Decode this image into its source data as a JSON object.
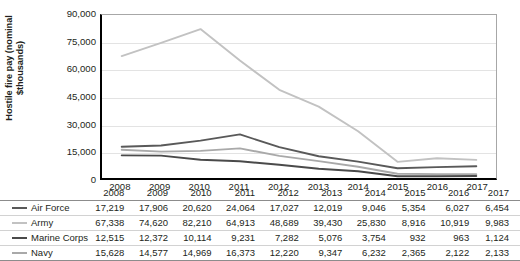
{
  "chart_data": {
    "type": "line",
    "title": "",
    "xlabel": "",
    "ylabel": "Hostile fire pay (nominal $thousands)",
    "categories": [
      "2008",
      "2009",
      "2010",
      "2011",
      "2012",
      "2013",
      "2014",
      "2015",
      "2016",
      "2017"
    ],
    "ylim": [
      0,
      90000
    ],
    "yticks": [
      "0",
      "15,000",
      "30,000",
      "45,000",
      "60,000",
      "75,000",
      "90,000"
    ],
    "ytick_values": [
      0,
      15000,
      30000,
      45000,
      60000,
      75000,
      90000
    ],
    "grid": true,
    "legend_position": "table-left",
    "series": [
      {
        "name": "Air Force",
        "color": "#595959",
        "values": [
          17219,
          17906,
          20620,
          24064,
          17027,
          12019,
          9046,
          5354,
          6027,
          6454
        ],
        "labels": [
          "17,219",
          "17,906",
          "20,620",
          "24,064",
          "17,027",
          "12,019",
          "9,046",
          "5,354",
          "6,027",
          "6,454"
        ]
      },
      {
        "name": "Army",
        "color": "#c2c2c2",
        "values": [
          67338,
          74620,
          82210,
          64913,
          48689,
          39430,
          25830,
          8916,
          10919,
          9983
        ],
        "labels": [
          "67,338",
          "74,620",
          "82,210",
          "64,913",
          "48,689",
          "39,430",
          "25,830",
          "8,916",
          "10,919",
          "9,983"
        ]
      },
      {
        "name": "Marine Corps",
        "color": "#4a4a4a",
        "values": [
          12515,
          12372,
          10114,
          9231,
          7282,
          5076,
          3754,
          932,
          963,
          1124
        ],
        "labels": [
          "12,515",
          "12,372",
          "10,114",
          "9,231",
          "7,282",
          "5,076",
          "3,754",
          "932",
          "963",
          "1,124"
        ]
      },
      {
        "name": "Navy",
        "color": "#a9a9a9",
        "values": [
          15628,
          14577,
          14969,
          16373,
          12220,
          9347,
          6232,
          2365,
          2122,
          2133
        ],
        "labels": [
          "15,628",
          "14,577",
          "14,969",
          "16,373",
          "12,220",
          "9,347",
          "6,232",
          "2,365",
          "2,122",
          "2,133"
        ]
      }
    ]
  },
  "table": {
    "corner_header": "",
    "column_headers": [
      "2008",
      "2009",
      "2010",
      "2011",
      "2012",
      "2013",
      "2014",
      "2015",
      "2016",
      "2017"
    ],
    "rows": [
      {
        "label": "Air Force",
        "color": "#595959",
        "values": [
          "17,219",
          "17,906",
          "20,620",
          "24,064",
          "17,027",
          "12,019",
          "9,046",
          "5,354",
          "6,027",
          "6,454"
        ]
      },
      {
        "label": "Army",
        "color": "#c2c2c2",
        "values": [
          "67,338",
          "74,620",
          "82,210",
          "64,913",
          "48,689",
          "39,430",
          "25,830",
          "8,916",
          "10,919",
          "9,983"
        ]
      },
      {
        "label": "Marine Corps",
        "color": "#4a4a4a",
        "values": [
          "12,515",
          "12,372",
          "10,114",
          "9,231",
          "7,282",
          "5,076",
          "3,754",
          "932",
          "963",
          "1,124"
        ]
      },
      {
        "label": "Navy",
        "color": "#a9a9a9",
        "values": [
          "15,628",
          "14,577",
          "14,969",
          "16,373",
          "12,220",
          "9,347",
          "6,232",
          "2,365",
          "2,122",
          "2,133"
        ]
      }
    ]
  }
}
